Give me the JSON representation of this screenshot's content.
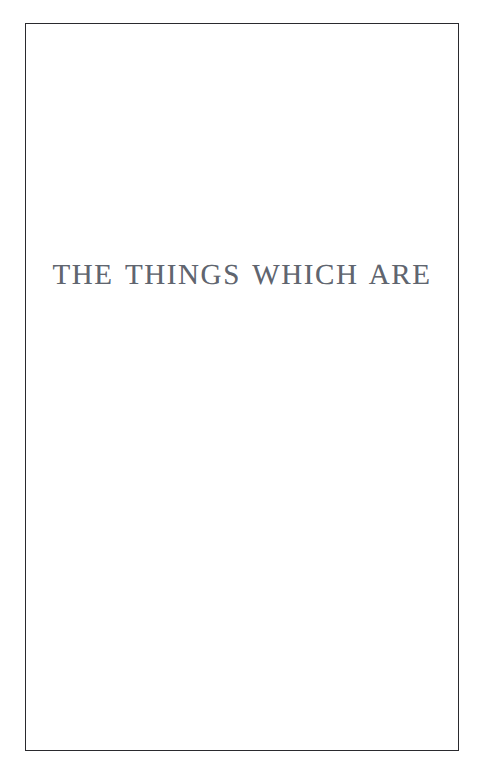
{
  "page": {
    "background_color": "#ffffff",
    "width": 482,
    "height": 773
  },
  "frame": {
    "name": "printed-rule-border",
    "color": "#2a2a2e",
    "thickness": "1.4px"
  },
  "content": {
    "section_title": "THE THINGS WHICH ARE",
    "title_color": "#575c67"
  }
}
